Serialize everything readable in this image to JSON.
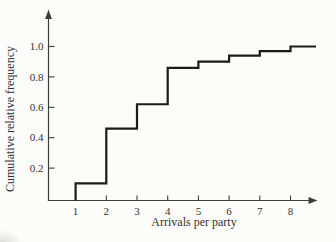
{
  "figure": {
    "background": "#fcfcfb",
    "line_color": "#1b1b1b",
    "axis_color": "#3d3d3d",
    "text_color": "#333333"
  },
  "chart_data": {
    "type": "line",
    "subtype": "cumulative-step-ogive",
    "title": "",
    "xlabel": "Arrivals per party",
    "ylabel": "Cumulative relative frequency",
    "x": [
      1,
      2,
      3,
      4,
      5,
      6,
      7,
      8
    ],
    "y": [
      0.1,
      0.46,
      0.62,
      0.86,
      0.9,
      0.94,
      0.97,
      1.0
    ],
    "x_ticks": [
      1,
      2,
      3,
      4,
      5,
      6,
      7,
      8
    ],
    "y_ticks": [
      0.2,
      0.4,
      0.6,
      0.8,
      1.0
    ],
    "xlim": [
      0.1,
      8.9
    ],
    "ylim": [
      0,
      1.2
    ],
    "grid": false,
    "legend": "none",
    "axis_arrows": true
  }
}
